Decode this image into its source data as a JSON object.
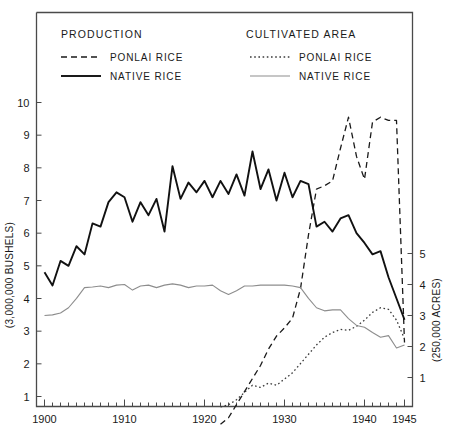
{
  "chart_data": {
    "type": "line",
    "title": "",
    "xlabel": "",
    "ylabel": "(3,000,000 BUSHELS)",
    "y2label": "(250,000 ACRES)",
    "xlim": [
      1899,
      1946
    ],
    "ylim": [
      0,
      10.6
    ],
    "y2lim": [
      0,
      5.9
    ],
    "grid": false,
    "legend_position": "top-inside",
    "x_ticks_major": [
      1900,
      1910,
      1920,
      1930,
      1940,
      1945
    ],
    "x_tick_labels": [
      "1900",
      "1910",
      "1920",
      "1930",
      "1940",
      "1945"
    ],
    "x_ticks_minor_step": 1,
    "y_ticks_left": [
      1,
      2,
      3,
      4,
      5,
      6,
      7,
      8,
      9,
      10
    ],
    "y_tick_labels_left": [
      "1",
      "2",
      "3",
      "4",
      "5",
      "6",
      "7",
      "8",
      "9",
      "10"
    ],
    "y_ticks_right": [
      1,
      2,
      3,
      4,
      5
    ],
    "y_tick_labels_right": [
      "1",
      "2",
      "3",
      "4",
      "5"
    ],
    "series": [
      {
        "name": "PONLAI RICE",
        "group": "PRODUCTION",
        "axis": "left",
        "style": "dashed",
        "color": "#1a1a1a",
        "width": 1.3,
        "x": [
          1922,
          1923,
          1924,
          1925,
          1926,
          1927,
          1928,
          1929,
          1930,
          1931,
          1932,
          1933,
          1934,
          1935,
          1936,
          1937,
          1938,
          1939,
          1940,
          1941,
          1942,
          1943,
          1944,
          1945
        ],
        "values": [
          0.15,
          0.35,
          0.75,
          1.15,
          1.55,
          1.95,
          2.45,
          2.85,
          3.1,
          3.4,
          4.3,
          5.95,
          7.35,
          7.45,
          7.6,
          8.6,
          9.55,
          8.35,
          7.65,
          9.4,
          9.55,
          9.45,
          9.45,
          2.65
        ]
      },
      {
        "name": "NATIVE RICE",
        "group": "PRODUCTION",
        "axis": "left",
        "style": "solid-thick",
        "color": "#111111",
        "width": 1.9,
        "x": [
          1900,
          1901,
          1902,
          1903,
          1904,
          1905,
          1906,
          1907,
          1908,
          1909,
          1910,
          1911,
          1912,
          1913,
          1914,
          1915,
          1916,
          1917,
          1918,
          1919,
          1920,
          1921,
          1922,
          1923,
          1924,
          1925,
          1926,
          1927,
          1928,
          1929,
          1930,
          1931,
          1932,
          1933,
          1934,
          1935,
          1936,
          1937,
          1938,
          1939,
          1940,
          1941,
          1942,
          1943,
          1944,
          1945
        ],
        "values": [
          4.8,
          4.4,
          5.15,
          5.0,
          5.6,
          5.35,
          6.3,
          6.2,
          6.95,
          7.25,
          7.1,
          6.35,
          6.95,
          6.55,
          7.05,
          6.05,
          8.05,
          7.05,
          7.55,
          7.25,
          7.6,
          7.1,
          7.6,
          7.2,
          7.8,
          7.15,
          8.5,
          7.35,
          7.95,
          7.0,
          7.85,
          7.1,
          7.6,
          7.5,
          6.2,
          6.35,
          6.05,
          6.45,
          6.55,
          6.0,
          5.7,
          5.35,
          5.45,
          4.65,
          4.0,
          3.35
        ]
      },
      {
        "name": "PONLAI RICE",
        "group": "CULTIVATED AREA",
        "axis": "right",
        "style": "dotted",
        "color": "#3a3a3a",
        "width": 1.3,
        "x": [
          1922,
          1923,
          1924,
          1925,
          1926,
          1927,
          1928,
          1929,
          1930,
          1931,
          1932,
          1933,
          1934,
          1935,
          1936,
          1937,
          1938,
          1939,
          1940,
          1941,
          1942,
          1943,
          1944,
          1945
        ],
        "values": [
          0.05,
          0.12,
          0.28,
          0.52,
          0.75,
          0.68,
          0.82,
          0.75,
          0.95,
          1.15,
          1.45,
          1.75,
          2.05,
          2.3,
          2.45,
          2.55,
          2.52,
          2.65,
          2.85,
          3.1,
          3.25,
          3.2,
          2.85,
          2.25
        ]
      },
      {
        "name": "NATIVE RICE",
        "group": "CULTIVATED AREA",
        "axis": "right",
        "style": "solid-thin",
        "color": "#8d8d8d",
        "width": 1.1,
        "x": [
          1900,
          1901,
          1902,
          1903,
          1904,
          1905,
          1906,
          1907,
          1908,
          1909,
          1910,
          1911,
          1912,
          1913,
          1914,
          1915,
          1916,
          1917,
          1918,
          1919,
          1920,
          1921,
          1922,
          1923,
          1924,
          1925,
          1926,
          1927,
          1928,
          1929,
          1930,
          1931,
          1932,
          1933,
          1934,
          1935,
          1936,
          1937,
          1938,
          1939,
          1940,
          1941,
          1942,
          1943,
          1944,
          1945
        ],
        "values": [
          3.0,
          3.02,
          3.08,
          3.25,
          3.55,
          3.9,
          3.92,
          3.95,
          3.9,
          3.98,
          4.0,
          3.82,
          3.95,
          3.98,
          3.9,
          3.98,
          4.02,
          3.98,
          3.9,
          3.95,
          3.95,
          3.98,
          3.8,
          3.68,
          3.8,
          3.95,
          3.95,
          3.98,
          3.98,
          3.98,
          3.98,
          3.95,
          3.9,
          3.55,
          3.25,
          3.15,
          3.18,
          3.18,
          2.9,
          2.68,
          2.62,
          2.45,
          2.3,
          2.35,
          1.95,
          2.05
        ]
      }
    ]
  },
  "legend": {
    "production": {
      "heading": "PRODUCTION",
      "items": [
        {
          "label": "PONLAI RICE",
          "style": "dashed"
        },
        {
          "label": "NATIVE RICE",
          "style": "solid-thick"
        }
      ]
    },
    "cultivated_area": {
      "heading": "CULTIVATED AREA",
      "items": [
        {
          "label": "PONLAI RICE",
          "style": "dotted"
        },
        {
          "label": "NATIVE RICE",
          "style": "solid-thin"
        }
      ]
    }
  },
  "axes": {
    "left_title": "(3,000,000 BUSHELS)",
    "right_title": "(250,000 ACRES)"
  },
  "colors": {
    "ink": "#1a1a1a",
    "frame": "#4a4a4a",
    "native_area": "#8d8d8d",
    "ponlai_area": "#3a3a3a",
    "background": "#ffffff"
  }
}
